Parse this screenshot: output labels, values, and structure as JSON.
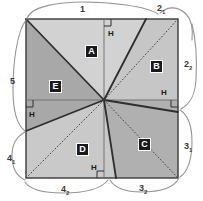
{
  "figure": {
    "type": "geometric-dissection-diagram",
    "shape": "square",
    "square": {
      "x": 26,
      "y": 19,
      "width": 152,
      "height": 159
    },
    "center": {
      "x": 104,
      "y": 100
    },
    "colors": {
      "region_a_fill": "#d2d2d2",
      "region_b_fill": "#c6c6c6",
      "region_c_fill": "#b0b0b0",
      "region_d_fill": "#c9c9c9",
      "region_e_fill": "#a8a8a8",
      "stroke": "#333333",
      "thin_stroke": "#555555",
      "dotted_stroke": "#4a4a4a",
      "brace_stroke": "#8a8a8a",
      "label_bg": "#1a1a1a",
      "label_text": "#ffffff",
      "background": "#ffffff"
    },
    "regions": [
      {
        "id": "A",
        "label": "A",
        "x": 85,
        "y": 45
      },
      {
        "id": "B",
        "label": "B",
        "x": 150,
        "y": 60
      },
      {
        "id": "C",
        "label": "C",
        "x": 138,
        "y": 138
      },
      {
        "id": "D",
        "label": "D",
        "x": 76,
        "y": 143
      },
      {
        "id": "E",
        "label": "E",
        "x": 49,
        "y": 80
      }
    ],
    "height_markers": [
      {
        "id": "h-top",
        "label": "H",
        "x": 108,
        "y": 29,
        "mark_x": 104,
        "mark_y": 19,
        "mark_dir": "tr"
      },
      {
        "id": "h-right",
        "label": "H",
        "x": 161,
        "y": 88,
        "mark_x": 178,
        "mark_y": 100,
        "mark_dir": "br"
      },
      {
        "id": "h-left",
        "label": "H",
        "x": 29,
        "y": 110,
        "mark_x": 26,
        "mark_y": 100,
        "mark_dir": "tl"
      },
      {
        "id": "h-bottom",
        "label": "H",
        "x": 91,
        "y": 163,
        "mark_x": 104,
        "mark_y": 178,
        "mark_dir": "bl"
      }
    ],
    "brace_labels": [
      {
        "id": "side-1",
        "text": "1",
        "sub": "",
        "x": 83,
        "y": 5
      },
      {
        "id": "side-2-1",
        "text": "2",
        "sub": "1",
        "x": 159,
        "y": 4
      },
      {
        "id": "side-2-2",
        "text": "2",
        "sub": "2",
        "x": 186,
        "y": 60
      },
      {
        "id": "side-3-1",
        "text": "3",
        "sub": "1",
        "x": 186,
        "y": 142
      },
      {
        "id": "side-3-2",
        "text": "3",
        "sub": "2",
        "x": 141,
        "y": 184
      },
      {
        "id": "side-4-2",
        "text": "4",
        "sub": "2",
        "x": 63,
        "y": 185
      },
      {
        "id": "side-4-1",
        "text": "4",
        "sub": "1",
        "x": 8,
        "y": 154
      },
      {
        "id": "side-5",
        "text": "5",
        "sub": "",
        "x": 11,
        "y": 77
      }
    ]
  }
}
